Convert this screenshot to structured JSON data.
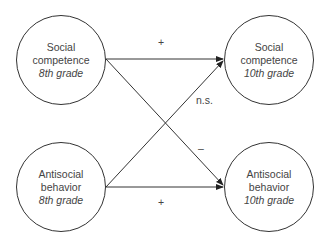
{
  "nodes": {
    "sc8": {
      "line1": "Social",
      "line2": "competence",
      "grade": "8th grade"
    },
    "sc10": {
      "line1": "Social",
      "line2": "competence",
      "grade": "10th grade"
    },
    "ab8": {
      "line1": "Antisocial",
      "line2": "behavior",
      "grade": "8th grade"
    },
    "ab10": {
      "line1": "Antisocial",
      "line2": "behavior",
      "grade": "10th grade"
    }
  },
  "edges": {
    "sc8_sc10": "+",
    "ab8_sc10": "n.s.",
    "sc8_ab10": "–",
    "ab8_ab10": "+"
  }
}
